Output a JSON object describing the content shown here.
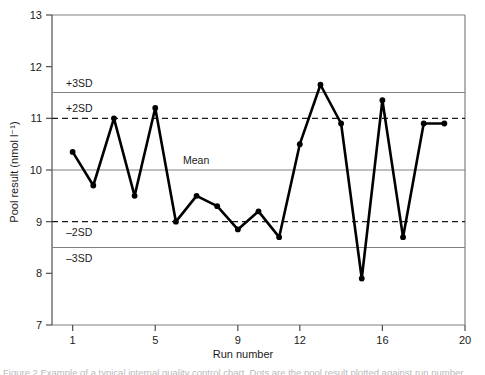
{
  "chart_data": {
    "type": "line",
    "title": "",
    "xlabel": "Run number",
    "ylabel": "Pool result (nmol l⁻¹)",
    "xlim": [
      0,
      20
    ],
    "ylim": [
      7,
      13
    ],
    "grid": false,
    "x_ticks": [
      1,
      5,
      9,
      12,
      16,
      20
    ],
    "x_tick_labels": [
      "1",
      "5",
      "9",
      "12",
      "16",
      "20"
    ],
    "y_ticks": [
      7,
      8,
      9,
      10,
      11,
      12,
      13
    ],
    "y_tick_labels": [
      "7",
      "8",
      "9",
      "10",
      "11",
      "12",
      "13"
    ],
    "marker": "filled-circle",
    "line_color": "#000000",
    "series": [
      {
        "name": "Pool result",
        "x": [
          1,
          2,
          3,
          4,
          5,
          6,
          7,
          8,
          9,
          10,
          11,
          12,
          13,
          14,
          15,
          16,
          17,
          18,
          19
        ],
        "values": [
          10.35,
          9.7,
          11.0,
          9.5,
          11.2,
          9.0,
          9.5,
          9.3,
          8.85,
          9.2,
          8.7,
          10.5,
          11.65,
          10.9,
          7.9,
          11.35,
          8.7,
          10.9,
          10.9
        ]
      }
    ],
    "reference_lines": [
      {
        "label": "+3SD",
        "value": 11.5,
        "style": "solid",
        "color": "#808080",
        "label_position": "above"
      },
      {
        "label": "+2SD",
        "value": 11.0,
        "style": "dashed",
        "color": "#1a1a1a",
        "label_position": "above"
      },
      {
        "label": "Mean",
        "value": 10.0,
        "style": "solid",
        "color": "#808080",
        "label_position": "above"
      },
      {
        "label": "–2SD",
        "value": 9.0,
        "style": "dashed",
        "color": "#1a1a1a",
        "label_position": "below"
      },
      {
        "label": "–3SD",
        "value": 8.5,
        "style": "solid",
        "color": "#808080",
        "label_position": "below"
      }
    ]
  },
  "caption": {
    "text": "Figure 2 Example of a typical internal quality control chart. Dots are the pool result plotted against run number."
  }
}
